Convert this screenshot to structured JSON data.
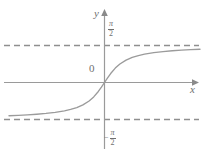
{
  "figure": {
    "title": "",
    "background_color": "#ffffff",
    "line_color": "#8a8a8a",
    "axis_color": "#9a9a9a",
    "label_color": "#6f6f6f"
  },
  "labels": {
    "y_axis": "y",
    "x_axis": "x",
    "origin": "0",
    "asymptote_upper_numerator": "π",
    "asymptote_upper_denominator": "2",
    "asymptote_lower_sign": "−",
    "asymptote_lower_numerator": "π",
    "asymptote_lower_denominator": "2"
  },
  "chart_data": {
    "type": "line",
    "title": "",
    "xlabel": "x",
    "ylabel": "y",
    "grid": false,
    "legend": "none",
    "function": "y = arctan(x)",
    "xlim": [
      -6.2,
      6.2
    ],
    "ylim": [
      -2.05,
      2.05
    ],
    "axis_ticks": {
      "x": [],
      "y": [
        "π/2",
        "−π/2"
      ]
    },
    "annotations": [
      {
        "text": "0",
        "x": -0.45,
        "y": 0.18,
        "role": "origin-label"
      },
      {
        "text": "π/2",
        "x": 0.3,
        "y": 1.78,
        "role": "upper-asymptote-label"
      },
      {
        "text": "−π/2",
        "x": 0.2,
        "y": -1.72,
        "role": "lower-asymptote-label"
      }
    ],
    "asymptotes": [
      {
        "type": "horizontal",
        "y": 1.5708,
        "label": "π/2",
        "style": "dashed"
      },
      {
        "type": "horizontal",
        "y": -1.5708,
        "label": "−π/2",
        "style": "dashed"
      }
    ],
    "series": [
      {
        "name": "arctan",
        "x": [
          -6.2,
          -5.6,
          -5.0,
          -4.4,
          -3.8,
          -3.2,
          -2.6,
          -2.2,
          -1.8,
          -1.4,
          -1.0,
          -0.7,
          -0.4,
          -0.2,
          0.0,
          0.2,
          0.4,
          0.7,
          1.0,
          1.4,
          1.8,
          2.2,
          2.6,
          3.2,
          3.8,
          4.4,
          5.0,
          5.6,
          6.2
        ],
        "y": [
          -1.411,
          -1.394,
          -1.373,
          -1.347,
          -1.314,
          -1.268,
          -1.203,
          -1.144,
          -1.064,
          -0.951,
          -0.785,
          -0.611,
          -0.381,
          -0.197,
          0.0,
          0.197,
          0.381,
          0.611,
          0.785,
          0.951,
          1.064,
          1.144,
          1.203,
          1.268,
          1.314,
          1.347,
          1.373,
          1.394,
          1.411
        ]
      }
    ]
  }
}
